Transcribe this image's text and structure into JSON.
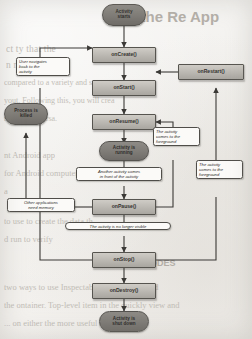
{
  "diagram": {
    "type": "flowchart",
    "colors": {
      "terminal_fill": "#7e7b76",
      "method_fill": "#bbb8b2",
      "note_fill": "#fbfaf8",
      "stroke": "#4f4d49",
      "page": "#f2f1ef"
    },
    "terminals": [
      {
        "id": "activity-starts",
        "lines": [
          "Activity",
          "starts"
        ]
      },
      {
        "id": "process-killed",
        "lines": [
          "Process is",
          "killed"
        ]
      },
      {
        "id": "activity-running",
        "lines": [
          "Activity is",
          "running"
        ]
      },
      {
        "id": "activity-shut-down",
        "lines": [
          "Activity is",
          "shut down"
        ]
      }
    ],
    "methods": [
      {
        "id": "on-create",
        "label": "onCreate()"
      },
      {
        "id": "on-start",
        "label": "onStart()"
      },
      {
        "id": "on-resume",
        "label": "onResume()"
      },
      {
        "id": "on-pause",
        "label": "onPause()"
      },
      {
        "id": "on-stop",
        "label": "onStop()"
      },
      {
        "id": "on-destroy",
        "label": "onDestroy()"
      },
      {
        "id": "on-restart",
        "label": "onRestart()"
      }
    ],
    "notes": [
      {
        "id": "user-navigates-back",
        "lines": [
          "User navigates",
          "back to the",
          "activity"
        ]
      },
      {
        "id": "another-activity-front",
        "lines": [
          "Another activity comes",
          "in front of the activity"
        ]
      },
      {
        "id": "foreground-from-pause",
        "lines": [
          "The activity",
          "comes to the",
          "foreground"
        ]
      },
      {
        "id": "foreground-from-stop",
        "lines": [
          "The activity",
          "comes to the",
          "foreground"
        ]
      },
      {
        "id": "other-apps-need-memory",
        "lines": [
          "Other applications",
          "need memory"
        ]
      },
      {
        "id": "no-longer-visible",
        "lines": [
          "The activity is no longer visible"
        ]
      }
    ]
  },
  "background_text": {
    "heading": "ng the Re     App",
    "lines": [
      "ct                  ty  that the",
      "n                  m      mo",
      "compared to a variety and so on",
      "yout. Following this, you will crea",
      "m, or vice versa.",
      "nt Android app",
      "for Android computer to test",
      "a",
      "to use to create the data th",
      "d run to verify",
      "ODES",
      "two ways to use Inspectable Sets or a method",
      "the ontainer. Top-level item in the quickly view and",
      "... on either the more useful for analysis"
    ]
  }
}
